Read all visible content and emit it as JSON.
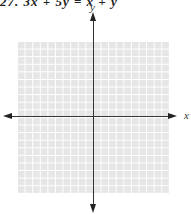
{
  "problem": {
    "heading": "27. 3x + 5y = x + y"
  },
  "graph": {
    "x_label": "x",
    "y_label": "y",
    "grid_cells": 20,
    "grid_color": "#e6e6e6",
    "grid_line_color": "#ffffff",
    "axis_color": "#333333"
  }
}
